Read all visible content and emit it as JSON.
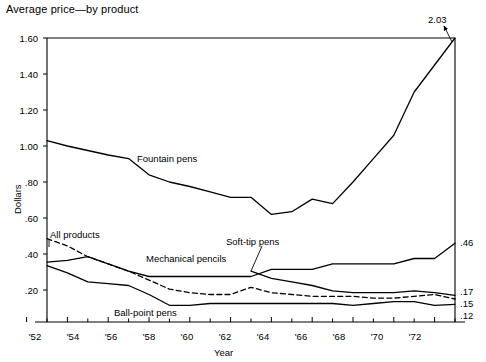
{
  "chart_data": {
    "type": "line",
    "title": "Average price—by product",
    "xlabel": "Year",
    "ylabel": "Dollars",
    "xlim": [
      1952,
      1973
    ],
    "ylim": [
      0.0,
      1.6
    ],
    "grid": false,
    "legend": "inline-labels",
    "y_ticks": [
      "1.60",
      "1.40",
      "1.20",
      "1.00",
      ".80",
      ".60",
      ".40",
      ".20"
    ],
    "y_tick_values": [
      1.6,
      1.4,
      1.2,
      1.0,
      0.8,
      0.6,
      0.4,
      0.2
    ],
    "x_ticks": [
      "'52",
      "'54",
      "'56",
      "'58",
      "'60",
      "'62",
      "'64",
      "'66",
      "'68",
      "'70",
      "'72"
    ],
    "x_tick_values": [
      1952,
      1954,
      1956,
      1958,
      1960,
      1962,
      1964,
      1966,
      1968,
      1970,
      1972
    ],
    "x": [
      1953,
      1954,
      1955,
      1956,
      1957,
      1958,
      1959,
      1960,
      1961,
      1962,
      1963,
      1964,
      1965,
      1966,
      1967,
      1968,
      1969,
      1970,
      1971,
      1972,
      1973
    ],
    "series": [
      {
        "name": "Fountain pens",
        "style": "solid",
        "end_value": "2.03",
        "values": [
          1.03,
          1.0,
          0.975,
          0.95,
          0.93,
          0.84,
          0.8,
          0.775,
          0.745,
          0.715,
          0.715,
          0.62,
          0.635,
          0.705,
          0.68,
          0.8,
          0.93,
          1.06,
          1.3,
          1.45,
          2.03
        ]
      },
      {
        "name": "Mechanical pencils",
        "style": "solid",
        "end_value": ".46",
        "values": [
          0.355,
          0.365,
          0.385,
          0.345,
          0.305,
          0.275,
          0.275,
          0.275,
          0.275,
          0.275,
          0.275,
          0.315,
          0.315,
          0.315,
          0.345,
          0.345,
          0.345,
          0.345,
          0.375,
          0.375,
          0.46
        ]
      },
      {
        "name": "All products",
        "style": "dashed",
        "end_value": ".15",
        "values": [
          0.485,
          0.445,
          0.385,
          0.345,
          0.305,
          0.255,
          0.205,
          0.185,
          0.175,
          0.175,
          0.215,
          0.185,
          0.175,
          0.165,
          0.165,
          0.165,
          0.155,
          0.155,
          0.165,
          0.175,
          0.15
        ]
      },
      {
        "name": "Soft-tip pens",
        "style": "solid",
        "end_value": ".17",
        "values": [
          null,
          null,
          null,
          null,
          null,
          null,
          null,
          null,
          null,
          null,
          0.305,
          0.265,
          0.245,
          0.225,
          0.195,
          0.185,
          0.185,
          0.185,
          0.195,
          0.185,
          0.17
        ]
      },
      {
        "name": "Ball-point pens",
        "style": "solid",
        "end_value": ".12",
        "values": [
          0.335,
          0.295,
          0.245,
          0.235,
          0.225,
          0.175,
          0.115,
          0.115,
          0.125,
          0.125,
          0.125,
          0.125,
          0.125,
          0.125,
          0.125,
          0.115,
          0.125,
          0.135,
          0.135,
          0.115,
          0.12
        ]
      }
    ],
    "annotations": [
      {
        "text": "2.03",
        "target_x": 1973,
        "target_y": 2.03
      }
    ]
  },
  "labels": {
    "fountain_pens": "Fountain pens",
    "mechanical_pencils": "Mechanical pencils",
    "all_products": "All products",
    "soft_tip_pens": "Soft-tip pens",
    "ball_point_pens": "Ball-point pens"
  },
  "end_labels": {
    "mechanical_pencils": ".46",
    "soft_tip_pens": ".17",
    "all_products": ".15",
    "ball_point_pens": ".12"
  },
  "annotation": {
    "peak": "2.03"
  },
  "y_tick_labels": {
    "t0": "1.60",
    "t1": "1.40",
    "t2": "1.20",
    "t3": "1.00",
    "t4": ".80",
    "t5": ".60",
    "t6": ".40",
    "t7": ".20"
  },
  "x_tick_labels": {
    "t0": "'52",
    "t1": "'54",
    "t2": "'56",
    "t3": "'58",
    "t4": "'60",
    "t5": "'62",
    "t6": "'64",
    "t7": "'66",
    "t8": "'68",
    "t9": "'70",
    "t10": "'72"
  },
  "axis_titles": {
    "x": "Year",
    "y": "Dollars"
  }
}
